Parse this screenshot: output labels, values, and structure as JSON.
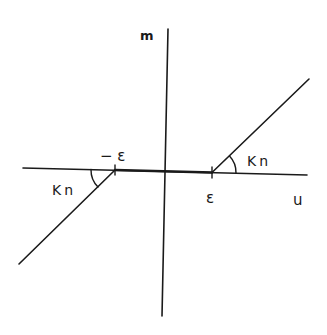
{
  "diagram": {
    "type": "dead-zone-nonlinearity",
    "axes": {
      "x_label": "u",
      "y_label": "m"
    },
    "labels": {
      "neg_threshold": "− ε",
      "pos_threshold": "ε",
      "slope_left": "Kn",
      "slope_right": "Kn"
    },
    "colors": {
      "stroke": "#1a1a1a",
      "background": "#ffffff"
    }
  }
}
